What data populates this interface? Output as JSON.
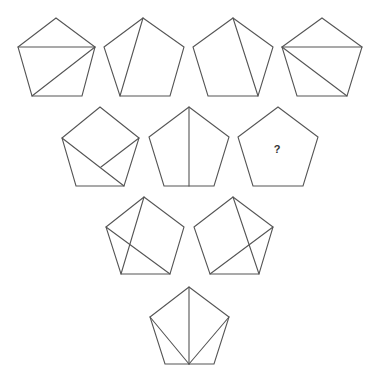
{
  "puzzle": {
    "stroke_color": "#555555",
    "background": "#ffffff",
    "question_mark": "?",
    "pentagons": [
      {
        "id": 1,
        "row": 1,
        "pts": [
          [
            56,
            18
          ],
          [
            95,
            47
          ],
          [
            82,
            96
          ],
          [
            32,
            96
          ],
          [
            18,
            47
          ]
        ],
        "chords": [
          [
            [
              18,
              47
            ],
            [
              95,
              47
            ]
          ],
          [
            [
              95,
              47
            ],
            [
              32,
              96
            ]
          ]
        ]
      },
      {
        "id": 2,
        "row": 1,
        "pts": [
          [
            143,
            18
          ],
          [
            184,
            47
          ],
          [
            170,
            96
          ],
          [
            120,
            96
          ],
          [
            104,
            47
          ]
        ],
        "chords": [
          [
            [
              143,
              18
            ],
            [
              120,
              96
            ]
          ]
        ]
      },
      {
        "id": 3,
        "row": 1,
        "pts": [
          [
            233,
            18
          ],
          [
            273,
            47
          ],
          [
            258,
            96
          ],
          [
            208,
            96
          ],
          [
            193,
            47
          ]
        ],
        "chords": [
          [
            [
              233,
              18
            ],
            [
              258,
              96
            ]
          ]
        ]
      },
      {
        "id": 4,
        "row": 1,
        "pts": [
          [
            322,
            18
          ],
          [
            362,
            47
          ],
          [
            347,
            96
          ],
          [
            297,
            96
          ],
          [
            282,
            47
          ]
        ],
        "chords": [
          [
            [
              282,
              47
            ],
            [
              362,
              47
            ]
          ],
          [
            [
              282,
              47
            ],
            [
              347,
              96
            ]
          ]
        ]
      },
      {
        "id": 5,
        "row": 2,
        "pts": [
          [
            100,
            107
          ],
          [
            139,
            138
          ],
          [
            124,
            186
          ],
          [
            76,
            186
          ],
          [
            62,
            138
          ]
        ],
        "chords": [
          [
            [
              62,
              138
            ],
            [
              124,
              186
            ]
          ],
          [
            [
              139,
              138
            ],
            [
              101,
              167
            ]
          ]
        ]
      },
      {
        "id": 6,
        "row": 2,
        "pts": [
          [
            189,
            107
          ],
          [
            229,
            137
          ],
          [
            214,
            186
          ],
          [
            164,
            186
          ],
          [
            149,
            137
          ]
        ],
        "chords": [
          [
            [
              189,
              107
            ],
            [
              189,
              186
            ]
          ]
        ]
      },
      {
        "id": 7,
        "row": 2,
        "pts": [
          [
            278,
            107
          ],
          [
            318,
            137
          ],
          [
            303,
            186
          ],
          [
            253,
            186
          ],
          [
            238,
            137
          ]
        ],
        "chords": [],
        "label": "?",
        "label_pos": [
          277,
          149
        ]
      },
      {
        "id": 8,
        "row": 3,
        "pts": [
          [
            144,
            197
          ],
          [
            184,
            227
          ],
          [
            170,
            274
          ],
          [
            121,
            274
          ],
          [
            106,
            227
          ]
        ],
        "chords": [
          [
            [
              144,
              197
            ],
            [
              121,
              274
            ]
          ],
          [
            [
              106,
              227
            ],
            [
              170,
              274
            ]
          ]
        ]
      },
      {
        "id": 9,
        "row": 3,
        "pts": [
          [
            233,
            197
          ],
          [
            273,
            227
          ],
          [
            259,
            274
          ],
          [
            210,
            274
          ],
          [
            194,
            227
          ]
        ],
        "chords": [
          [
            [
              233,
              197
            ],
            [
              259,
              274
            ]
          ],
          [
            [
              273,
              227
            ],
            [
              210,
              274
            ]
          ]
        ]
      },
      {
        "id": 10,
        "row": 4,
        "pts": [
          [
            189,
            287
          ],
          [
            229,
            317
          ],
          [
            214,
            364
          ],
          [
            165,
            364
          ],
          [
            150,
            317
          ]
        ],
        "chords": [
          [
            [
              189,
              287
            ],
            [
              189,
              364
            ]
          ],
          [
            [
              150,
              317
            ],
            [
              189,
              364
            ]
          ],
          [
            [
              229,
              317
            ],
            [
              189,
              364
            ]
          ]
        ]
      }
    ]
  }
}
